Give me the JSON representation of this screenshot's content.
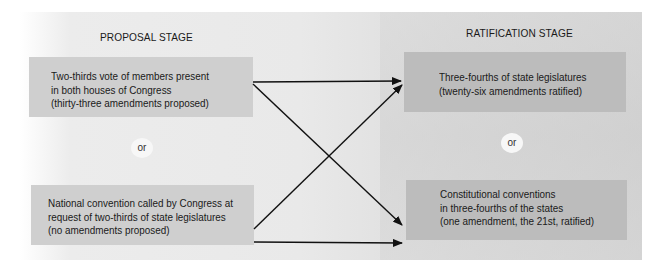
{
  "diagram": {
    "proposal_stage": {
      "title": "PROPOSAL STAGE",
      "methods": [
        {
          "lines": [
            "Two-thirds vote of members present",
            "in both houses of Congress",
            "(thirty-three amendments proposed)"
          ]
        },
        {
          "lines": [
            "National convention called by Congress at",
            "request of two-thirds of state legislatures",
            "(no amendments proposed)"
          ]
        }
      ],
      "separator": "or"
    },
    "ratification_stage": {
      "title": "RATIFICATION STAGE",
      "methods": [
        {
          "lines": [
            "Three-fourths of state legislatures",
            "(twenty-six amendments ratified)"
          ]
        },
        {
          "lines": [
            "Constitutional conventions",
            "in three-fourths of the states",
            "(one amendment, the 21st, ratified)"
          ]
        }
      ],
      "separator": "or"
    },
    "connections": [
      {
        "from": "proposal.0",
        "to": "ratification.0"
      },
      {
        "from": "proposal.0",
        "to": "ratification.1"
      },
      {
        "from": "proposal.1",
        "to": "ratification.0"
      },
      {
        "from": "proposal.1",
        "to": "ratification.1"
      }
    ],
    "colors": {
      "proposal_box": "#cfcfcf",
      "ratification_box": "#bcbcbc",
      "background": "#e9e9e9",
      "arrow": "#111111"
    }
  }
}
